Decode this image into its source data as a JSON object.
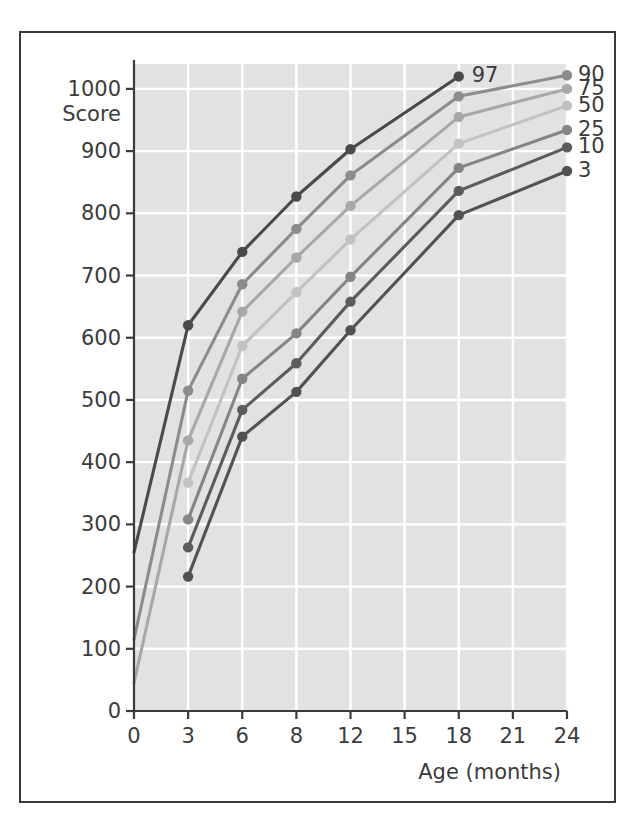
{
  "figure": {
    "background_color": "#ffffff",
    "plot_background_color": "#e2e2e2",
    "grid_color": "#ffffff",
    "axis_color": "#3b3b3d",
    "border_color": "#3a3a3c"
  },
  "chart_data": {
    "type": "line",
    "title": "",
    "xlabel": "Age (months)",
    "ylabel": "Score",
    "x_tick_labels": [
      "0",
      "3",
      "6",
      "8",
      "12",
      "15",
      "18",
      "21",
      "24"
    ],
    "x_ticks": [
      0,
      3,
      6,
      8,
      12,
      15,
      18,
      21,
      24
    ],
    "y_tick_labels": [
      "0",
      "100",
      "200",
      "300",
      "400",
      "500",
      "600",
      "700",
      "800",
      "900",
      "1000"
    ],
    "y_ticks": [
      0,
      100,
      200,
      300,
      400,
      500,
      600,
      700,
      800,
      900,
      1000
    ],
    "ylim": [
      0,
      1040
    ],
    "grid": true,
    "legend_position": "right",
    "annotations": [
      {
        "text": "97",
        "x": 18,
        "y": 1020
      }
    ],
    "series": [
      {
        "name": "97",
        "label": "97",
        "color": "#4a4a4c",
        "x": [
          0,
          3,
          6,
          8,
          12,
          18
        ],
        "values": [
          255,
          620,
          738,
          827,
          903,
          1020
        ],
        "markers_from": 3,
        "legend_shown": false
      },
      {
        "name": "90",
        "label": "90",
        "color": "#8c8c8e",
        "x": [
          0,
          3,
          6,
          8,
          12,
          18,
          24
        ],
        "values": [
          115,
          515,
          686,
          775,
          861,
          988,
          1022
        ],
        "markers_from": 3,
        "legend_shown": true
      },
      {
        "name": "75",
        "label": "75",
        "color": "#a8a8aa",
        "x": [
          0,
          3,
          6,
          8,
          12,
          18,
          24
        ],
        "values": [
          45,
          435,
          642,
          729,
          812,
          955,
          1000
        ],
        "markers_from": 3,
        "legend_shown": true
      },
      {
        "name": "50",
        "label": "50",
        "color": "#c2c2c4",
        "x": [
          3,
          6,
          8,
          12,
          18,
          24
        ],
        "values": [
          367,
          587,
          673,
          758,
          912,
          973
        ],
        "markers_from": 3,
        "legend_shown": true
      },
      {
        "name": "25",
        "label": "25",
        "color": "#858587",
        "x": [
          3,
          6,
          8,
          12,
          18,
          24
        ],
        "values": [
          308,
          534,
          607,
          698,
          873,
          934
        ],
        "markers_from": 3,
        "legend_shown": true
      },
      {
        "name": "10",
        "label": "10",
        "color": "#5c5c5e",
        "x": [
          3,
          6,
          8,
          12,
          18,
          24
        ],
        "values": [
          263,
          484,
          559,
          658,
          836,
          906
        ],
        "markers_from": 3,
        "legend_shown": true
      },
      {
        "name": "3",
        "label": "3",
        "color": "#525254",
        "x": [
          3,
          6,
          8,
          12,
          18,
          24
        ],
        "values": [
          216,
          441,
          513,
          612,
          797,
          868
        ],
        "markers_from": 3,
        "legend_shown": true
      }
    ]
  }
}
